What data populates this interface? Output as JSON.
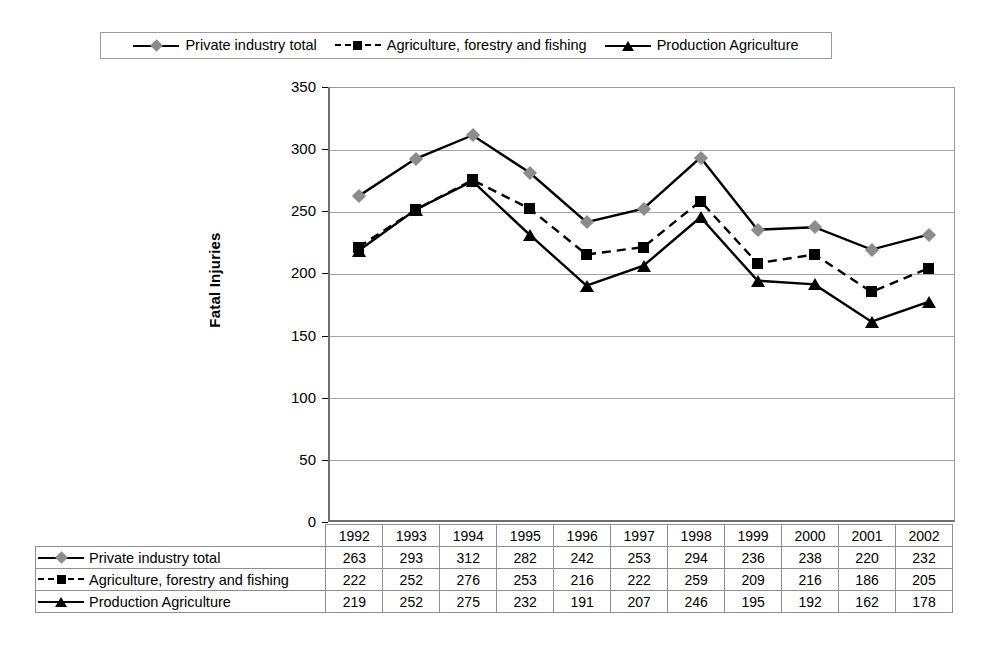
{
  "legend": {
    "entries": [
      {
        "label": "Private industry total",
        "marker": "diamond",
        "line": "solid",
        "color": "#8c8c8c"
      },
      {
        "label": "Agriculture, forestry and fishing",
        "marker": "square",
        "line": "dashed",
        "color": "#000000"
      },
      {
        "label": "Production Agriculture",
        "marker": "triangle",
        "line": "solid",
        "color": "#000000"
      }
    ]
  },
  "axis": {
    "y_title": "Fatal Injuries",
    "y_ticks": [
      "350",
      "300",
      "250",
      "200",
      "150",
      "100",
      "50",
      "0"
    ]
  },
  "table": {
    "years": [
      "1992",
      "1993",
      "1994",
      "1995",
      "1996",
      "1997",
      "1998",
      "1999",
      "2000",
      "2001",
      "2002"
    ],
    "rows": [
      {
        "label": "Private industry total",
        "values": [
          "263",
          "293",
          "312",
          "282",
          "242",
          "253",
          "294",
          "236",
          "238",
          "220",
          "232"
        ]
      },
      {
        "label": "Agriculture, forestry and fishing",
        "values": [
          "222",
          "252",
          "276",
          "253",
          "216",
          "222",
          "259",
          "209",
          "216",
          "186",
          "205"
        ]
      },
      {
        "label": "Production Agriculture",
        "values": [
          "219",
          "252",
          "275",
          "232",
          "191",
          "207",
          "246",
          "195",
          "192",
          "162",
          "178"
        ]
      }
    ]
  },
  "chart_data": {
    "type": "line",
    "title": "",
    "xlabel": "",
    "ylabel": "Fatal Injuries",
    "categories": [
      "1992",
      "1993",
      "1994",
      "1995",
      "1996",
      "1997",
      "1998",
      "1999",
      "2000",
      "2001",
      "2002"
    ],
    "ylim": [
      0,
      350
    ],
    "ytick_step": 50,
    "grid": true,
    "legend_position": "top",
    "series": [
      {
        "name": "Private industry total",
        "values": [
          263,
          293,
          312,
          282,
          242,
          253,
          294,
          236,
          238,
          220,
          232
        ],
        "marker": "diamond",
        "marker_color": "#8c8c8c",
        "line_style": "solid",
        "line_color": "#000000"
      },
      {
        "name": "Agriculture, forestry and fishing",
        "values": [
          222,
          252,
          276,
          253,
          216,
          222,
          259,
          209,
          216,
          186,
          205
        ],
        "marker": "square",
        "marker_color": "#000000",
        "line_style": "dashed",
        "line_color": "#000000"
      },
      {
        "name": "Production Agriculture",
        "values": [
          219,
          252,
          275,
          232,
          191,
          207,
          246,
          195,
          192,
          162,
          178
        ],
        "marker": "triangle",
        "marker_color": "#000000",
        "line_style": "solid",
        "line_color": "#000000"
      }
    ]
  }
}
